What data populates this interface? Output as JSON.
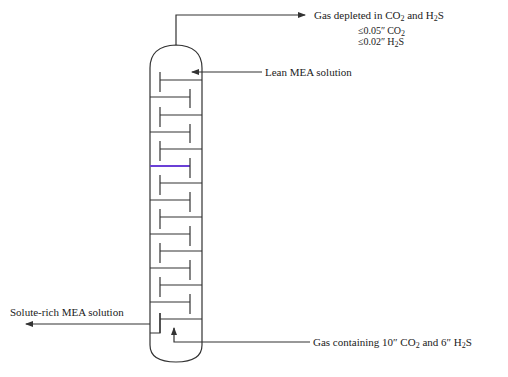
{
  "diagram": {
    "column": {
      "type": "tray-column",
      "tray_count": 14,
      "accent_tray_index": 6,
      "accent_color": "#6a3fd6",
      "line_color": "#333333"
    },
    "streams": {
      "top_outlet": {
        "label_prefix": "Gas depleted in CO",
        "label_sub1": "2",
        "label_mid": " and H",
        "label_sub2": "2",
        "label_suffix": "S",
        "spec1_prefix": "≤0.05″ CO",
        "spec1_sub": "2",
        "spec2_prefix": "≤0.02″ H",
        "spec2_sub": "2",
        "spec2_suffix": "S",
        "direction": "out"
      },
      "lean_inlet": {
        "label": "Lean MEA solution",
        "direction": "in"
      },
      "rich_outlet": {
        "label": "Solute-rich MEA solution",
        "direction": "out"
      },
      "gas_inlet": {
        "label_prefix": "Gas containing 10″ CO",
        "label_sub1": "2",
        "label_mid": " and 6″ H",
        "label_sub2": "2",
        "label_suffix": "S",
        "direction": "in"
      }
    }
  }
}
